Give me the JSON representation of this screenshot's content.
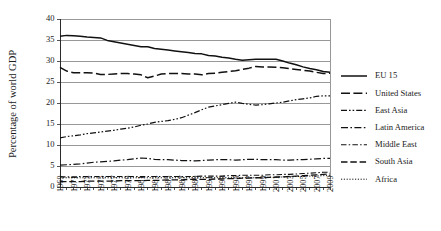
{
  "chart_data": {
    "type": "line",
    "title": "",
    "xlabel": "",
    "ylabel": "Percentage of world GDP",
    "ylim": [
      0,
      40
    ],
    "ytick_step": 5,
    "yticks": [
      0,
      5,
      10,
      15,
      20,
      25,
      30,
      35,
      40
    ],
    "grid": true,
    "legend_position": "right",
    "x": [
      1969,
      1970,
      1971,
      1972,
      1973,
      1974,
      1975,
      1976,
      1977,
      1978,
      1979,
      1980,
      1981,
      1982,
      1983,
      1984,
      1985,
      1986,
      1987,
      1988,
      1989,
      1990,
      1991,
      1992,
      1993,
      1994,
      1995,
      1996,
      1997,
      1998,
      1999,
      2000,
      2001,
      2002,
      2003,
      2004,
      2005,
      2006,
      2007,
      2008,
      2009
    ],
    "xtick_labels": [
      "1969",
      "1971",
      "1973",
      "1975",
      "1977",
      "1979",
      "1981",
      "1983",
      "1985",
      "1987",
      "1989",
      "1991",
      "1993",
      "1995",
      "1997",
      "1999",
      "2001",
      "2003",
      "2005",
      "2007",
      "2009"
    ],
    "series": [
      {
        "name": "EU 15",
        "dash": "none",
        "width": 1.5,
        "values": [
          35.9,
          36.1,
          36.0,
          35.9,
          35.7,
          35.6,
          35.5,
          34.9,
          34.6,
          34.3,
          34.0,
          33.7,
          33.4,
          33.4,
          33.0,
          32.8,
          32.6,
          32.4,
          32.2,
          32.0,
          31.8,
          31.7,
          31.3,
          31.2,
          30.9,
          30.7,
          30.4,
          30.2,
          30.3,
          30.4,
          30.4,
          30.4,
          30.4,
          30.0,
          29.5,
          29.1,
          28.6,
          28.2,
          27.9,
          27.5,
          27.3
        ]
      },
      {
        "name": "United States",
        "dash": "long-dash",
        "width": 1.5,
        "values": [
          28.5,
          27.6,
          27.2,
          27.2,
          27.2,
          27.1,
          26.8,
          26.8,
          26.9,
          27.0,
          27.0,
          26.9,
          26.7,
          26.0,
          26.4,
          26.9,
          27.0,
          27.0,
          27.0,
          26.9,
          26.9,
          26.7,
          27.0,
          27.1,
          27.3,
          27.5,
          27.7,
          28.0,
          28.3,
          28.7,
          28.6,
          28.6,
          28.5,
          28.4,
          28.2,
          28.0,
          27.8,
          27.6,
          27.3,
          27.0,
          27.1
        ]
      },
      {
        "name": "East Asia",
        "dash": "dash-dot-dot",
        "width": 1.2,
        "values": [
          11.7,
          12.0,
          12.2,
          12.4,
          12.7,
          12.9,
          13.1,
          13.3,
          13.5,
          13.8,
          14.0,
          14.3,
          14.7,
          15.0,
          15.4,
          15.6,
          15.8,
          16.1,
          16.5,
          17.1,
          17.7,
          18.4,
          19.0,
          19.3,
          19.6,
          19.9,
          20.2,
          19.9,
          19.7,
          19.5,
          19.6,
          19.8,
          20.0,
          20.2,
          20.5,
          20.8,
          21.0,
          21.2,
          21.6,
          21.7,
          21.7
        ]
      },
      {
        "name": "Latin America",
        "dash": "dash-dot-long",
        "width": 1.2,
        "values": [
          5.2,
          5.3,
          5.4,
          5.5,
          5.7,
          5.9,
          6.0,
          6.1,
          6.2,
          6.4,
          6.5,
          6.7,
          6.9,
          6.8,
          6.6,
          6.5,
          6.5,
          6.4,
          6.3,
          6.3,
          6.2,
          6.3,
          6.4,
          6.5,
          6.5,
          6.5,
          6.4,
          6.5,
          6.6,
          6.6,
          6.5,
          6.5,
          6.5,
          6.4,
          6.4,
          6.5,
          6.5,
          6.6,
          6.7,
          6.8,
          6.8
        ]
      },
      {
        "name": "Middle East",
        "dash": "dash-dot",
        "width": 1.1,
        "values": [
          2.4,
          2.4,
          2.4,
          2.5,
          2.5,
          2.5,
          2.5,
          2.5,
          2.5,
          2.5,
          2.5,
          2.5,
          2.5,
          2.5,
          2.5,
          2.5,
          2.5,
          2.5,
          2.5,
          2.5,
          2.5,
          2.6,
          2.6,
          2.6,
          2.6,
          2.7,
          2.7,
          2.8,
          2.8,
          2.8,
          2.8,
          2.9,
          2.9,
          3.0,
          3.0,
          3.1,
          3.2,
          3.3,
          3.4,
          3.5,
          3.5
        ]
      },
      {
        "name": "South Asia",
        "dash": "medium-dash",
        "width": 1.3,
        "values": [
          1.3,
          1.3,
          1.3,
          1.3,
          1.4,
          1.4,
          1.4,
          1.4,
          1.4,
          1.5,
          1.5,
          1.5,
          1.5,
          1.6,
          1.6,
          1.6,
          1.7,
          1.7,
          1.7,
          1.8,
          1.8,
          1.8,
          1.8,
          1.9,
          1.9,
          2.0,
          2.0,
          2.1,
          2.1,
          2.2,
          2.2,
          2.3,
          2.4,
          2.4,
          2.5,
          2.6,
          2.7,
          2.8,
          2.9,
          3.0,
          3.1
        ]
      },
      {
        "name": "Africa",
        "dash": "dotted",
        "width": 1.0,
        "values": [
          2.2,
          2.2,
          2.2,
          2.2,
          2.2,
          2.2,
          2.2,
          2.2,
          2.2,
          2.2,
          2.2,
          2.2,
          2.2,
          2.2,
          2.2,
          2.2,
          2.2,
          2.2,
          2.2,
          2.2,
          2.2,
          2.2,
          2.2,
          2.2,
          2.2,
          2.2,
          2.2,
          2.2,
          2.2,
          2.2,
          2.3,
          2.3,
          2.3,
          2.4,
          2.4,
          2.5,
          2.5,
          2.6,
          2.6,
          2.7,
          2.7
        ]
      }
    ]
  }
}
